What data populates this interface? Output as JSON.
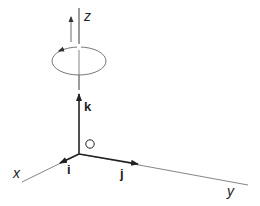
{
  "diagram": {
    "axes": {
      "x": "x",
      "y": "y",
      "z": "z"
    },
    "unit_vectors": {
      "i": "i",
      "j": "j",
      "k": "k"
    },
    "origin": "O",
    "rotation_indicator": "counterclockwise rotation about z-axis",
    "colors": {
      "line": "#333333",
      "thin": "#555555",
      "background": "#ffffff"
    }
  }
}
